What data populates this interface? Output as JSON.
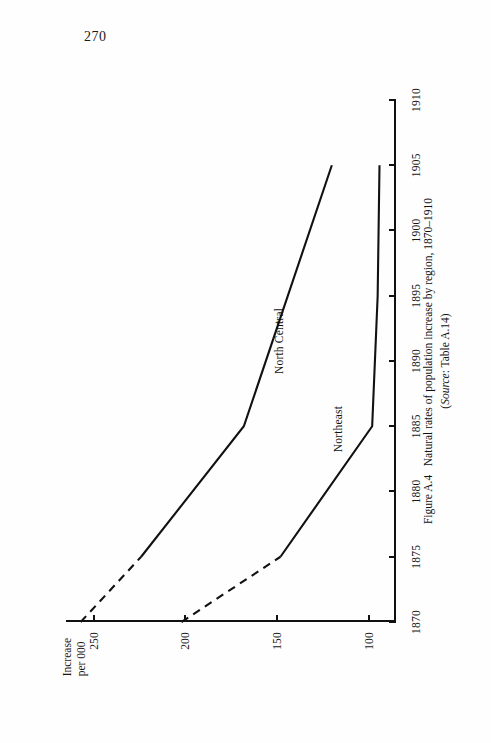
{
  "page": {
    "number": "270"
  },
  "figure": {
    "caption_label": "Figure A.4",
    "caption_text": "Natural rates of population increase by region, 1870–1910",
    "source_prefix": "Source",
    "source_text": ": Table A.14)",
    "source_open": "("
  },
  "chart_data": {
    "type": "line",
    "title": "Natural rates of population increase by region, 1870–1910",
    "xlabel": "",
    "ylabel": "Increase per 000",
    "ylabel_lines": [
      "Increase",
      "per 000"
    ],
    "orientation": "rotated-90-on-page",
    "grid": false,
    "legend": "inline-labels",
    "x": [
      1870,
      1875,
      1880,
      1885,
      1890,
      1895,
      1900,
      1905,
      1910
    ],
    "xticks": [
      "1870",
      "1875",
      "1880",
      "1885",
      "1890",
      "1895",
      "1900",
      "1905",
      "1910"
    ],
    "xlim": [
      1870,
      1910
    ],
    "yticks": [
      "250",
      "200",
      "150",
      "100"
    ],
    "ytickvals": [
      250,
      200,
      150,
      100
    ],
    "ylim": [
      265,
      85
    ],
    "y_axis_reversed": true,
    "series": [
      {
        "name": "North Central",
        "x": [
          1870,
          1875,
          1885,
          1905
        ],
        "values": [
          257,
          224,
          168,
          120
        ],
        "dashed_segment_x": [
          1870,
          1875
        ],
        "dashed_segment_values": [
          257,
          224
        ],
        "label_x": 1889,
        "label_value": 152
      },
      {
        "name": "Northeast",
        "x": [
          1870,
          1875,
          1885,
          1895,
          1905
        ],
        "values": [
          202,
          148,
          98,
          95,
          94
        ],
        "dashed_segment_x": [
          1870,
          1875
        ],
        "dashed_segment_values": [
          202,
          148
        ],
        "label_x": 1883,
        "label_value": 120
      }
    ]
  }
}
